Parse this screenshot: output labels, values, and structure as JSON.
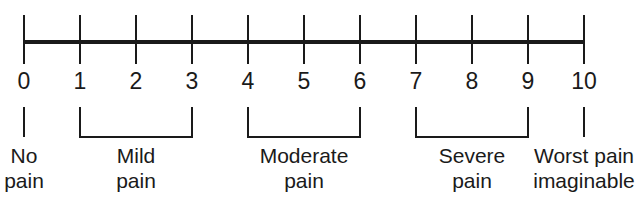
{
  "figure": {
    "name": "numeric-pain-rating-scale",
    "width": 643,
    "height": 205,
    "background_color": "#ffffff",
    "ink_color": "#1a1a1a"
  },
  "axis": {
    "orientation": "horizontal",
    "min": 0,
    "max": 10,
    "step": 1,
    "line_y": 42,
    "line_thickness": 4,
    "tick_top": 15,
    "tick_bottom": 64,
    "tick_thickness": 2,
    "first_tick_x": 24,
    "tick_spacing": 56,
    "tick_values": [
      "0",
      "1",
      "2",
      "3",
      "4",
      "5",
      "6",
      "7",
      "8",
      "9",
      "10"
    ]
  },
  "brackets": [
    {
      "id": "no-pain",
      "type": "single-line",
      "start_value": 0,
      "end_value": 0,
      "x_start": 24,
      "x_end": 24,
      "top_y": 107,
      "bottom_y": 137
    },
    {
      "id": "mild-pain",
      "type": "u-bracket",
      "start_value": 1,
      "end_value": 3,
      "x_start": 80,
      "x_end": 192,
      "top_y": 107,
      "bottom_y": 137
    },
    {
      "id": "moderate-pain",
      "type": "u-bracket",
      "start_value": 4,
      "end_value": 6,
      "x_start": 248,
      "x_end": 360,
      "top_y": 107,
      "bottom_y": 137
    },
    {
      "id": "severe-pain",
      "type": "u-bracket",
      "start_value": 7,
      "end_value": 9,
      "x_start": 416,
      "x_end": 528,
      "top_y": 107,
      "bottom_y": 137
    },
    {
      "id": "worst-pain",
      "type": "single-line",
      "start_value": 10,
      "end_value": 10,
      "x_start": 584,
      "x_end": 584,
      "top_y": 107,
      "bottom_y": 137
    }
  ],
  "categories": [
    {
      "id": "no-pain",
      "line1": "No",
      "line2": "pain",
      "center_x": 24
    },
    {
      "id": "mild-pain",
      "line1": "Mild",
      "line2": "pain",
      "center_x": 136
    },
    {
      "id": "moderate-pain",
      "line1": "Moderate",
      "line2": "pain",
      "center_x": 304
    },
    {
      "id": "severe-pain",
      "line1": "Severe",
      "line2": "pain",
      "center_x": 472
    },
    {
      "id": "worst-pain",
      "line1": "Worst pain",
      "line2": "imaginable",
      "center_x": 584
    }
  ],
  "chart_data": {
    "type": "scale",
    "title": "",
    "subtitle": "",
    "xlabel": "",
    "ylabel": "",
    "xlim": [
      0,
      10
    ],
    "grid": false,
    "legend": "none",
    "categories": [
      "0",
      "1",
      "2",
      "3",
      "4",
      "5",
      "6",
      "7",
      "8",
      "9",
      "10"
    ],
    "values": [
      0,
      1,
      2,
      3,
      4,
      5,
      6,
      7,
      8,
      9,
      10
    ],
    "tick_labels": [
      "0",
      "1",
      "2",
      "3",
      "4",
      "5",
      "6",
      "7",
      "8",
      "9",
      "10"
    ],
    "annotations": [
      {
        "label": "No pain",
        "range": [
          0,
          0
        ]
      },
      {
        "label": "Mild pain",
        "range": [
          1,
          3
        ]
      },
      {
        "label": "Moderate pain",
        "range": [
          4,
          6
        ]
      },
      {
        "label": "Severe pain",
        "range": [
          7,
          9
        ]
      },
      {
        "label": "Worst pain imaginable",
        "range": [
          10,
          10
        ]
      }
    ]
  }
}
